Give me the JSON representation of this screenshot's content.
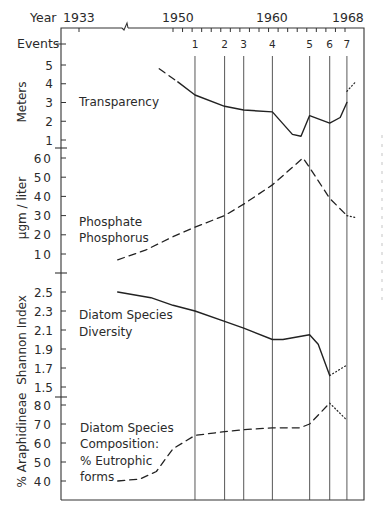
{
  "chart_data": {
    "type": "line",
    "title": "",
    "x_axis": {
      "label": "Year",
      "tick_labels": [
        "1933",
        "1950",
        "1960",
        "1968"
      ],
      "axis_break_between": [
        "1933",
        "1950"
      ],
      "minor_ticks_per_year": 1,
      "range": [
        1933,
        1969
      ]
    },
    "events": {
      "label": "Events",
      "items": [
        {
          "label": "1",
          "year": 1952.3
        },
        {
          "label": "2",
          "year": 1955.4
        },
        {
          "label": "3",
          "year": 1957.4
        },
        {
          "label": "4",
          "year": 1960.4
        },
        {
          "label": "5",
          "year": 1964.3
        },
        {
          "label": "6",
          "year": 1966.4
        },
        {
          "label": "7",
          "year": 1968.2
        }
      ]
    },
    "panels": [
      {
        "name": "transparency",
        "ylabel": "Meters",
        "series_label": [
          "Transparency"
        ],
        "y_ticks": [
          "5",
          "4",
          "3",
          "2",
          "1"
        ],
        "ylim": [
          0.6,
          5.4
        ],
        "segments": [
          {
            "style": "dashed",
            "points": [
              [
                1947.5,
                4.8
              ],
              [
                1950.5,
                4.1
              ]
            ]
          },
          {
            "style": "solid",
            "points": [
              [
                1950.5,
                4.1
              ],
              [
                1952.3,
                3.4
              ],
              [
                1955.4,
                2.8
              ],
              [
                1957.4,
                2.6
              ],
              [
                1960.4,
                2.5
              ],
              [
                1962.5,
                1.3
              ],
              [
                1963.4,
                1.2
              ],
              [
                1964.3,
                2.3
              ],
              [
                1966.4,
                1.9
              ],
              [
                1967.5,
                2.2
              ],
              [
                1968.2,
                3.0
              ]
            ]
          },
          {
            "style": "dotted",
            "points": [
              [
                1968.2,
                3.6
              ],
              [
                1969.1,
                4.1
              ]
            ]
          }
        ]
      },
      {
        "name": "phosphate",
        "ylabel": "μgm / liter",
        "series_label": [
          "Phosphate",
          "Phosphorus"
        ],
        "y_ticks": [
          "60",
          "50",
          "40",
          "30",
          "20",
          "10"
        ],
        "ylim": [
          0,
          65
        ],
        "segments": [
          {
            "style": "dashed",
            "points": [
              [
                1940,
                7
              ],
              [
                1945,
                12
              ],
              [
                1950,
                19
              ],
              [
                1952.3,
                24
              ],
              [
                1955.4,
                30
              ],
              [
                1957.4,
                36
              ],
              [
                1960.4,
                46
              ],
              [
                1963.6,
                60
              ],
              [
                1964.3,
                55
              ],
              [
                1966.4,
                39
              ],
              [
                1968.2,
                30
              ]
            ]
          },
          {
            "style": "dotted",
            "points": [
              [
                1968.2,
                30
              ],
              [
                1969.1,
                29
              ]
            ]
          }
        ]
      },
      {
        "name": "diversity",
        "ylabel": "Shannon Index",
        "series_label": [
          "Diatom Species",
          "Diversity"
        ],
        "y_ticks": [
          "2.5",
          "2.3",
          "2.1",
          "1.9",
          "1.7",
          "1.5"
        ],
        "ylim": [
          1.42,
          2.62
        ],
        "segments": [
          {
            "style": "solid",
            "points": [
              [
                1940,
                2.5
              ],
              [
                1946,
                2.44
              ],
              [
                1950,
                2.36
              ],
              [
                1952.3,
                2.3
              ],
              [
                1955.4,
                2.19
              ],
              [
                1957.4,
                2.12
              ],
              [
                1960.4,
                2.0
              ],
              [
                1961.5,
                2.0
              ],
              [
                1964.3,
                2.05
              ],
              [
                1965.2,
                1.95
              ],
              [
                1966.4,
                1.62
              ]
            ]
          },
          {
            "style": "dotted",
            "points": [
              [
                1966.4,
                1.62
              ],
              [
                1968.2,
                1.73
              ]
            ]
          }
        ]
      },
      {
        "name": "composition",
        "ylabel": "% Araphidineae",
        "series_label": [
          "Diatom Species",
          "Composition:",
          "% Eutrophic",
          "forms"
        ],
        "y_ticks": [
          "80",
          "70",
          "60",
          "50",
          "40"
        ],
        "ylim": [
          30,
          85
        ],
        "segments": [
          {
            "style": "dashed",
            "points": [
              [
                1940,
                40
              ],
              [
                1944,
                41
              ],
              [
                1947,
                45
              ],
              [
                1950,
                57
              ],
              [
                1952.3,
                64
              ],
              [
                1955.4,
                66
              ],
              [
                1957.4,
                67
              ],
              [
                1960.4,
                68
              ],
              [
                1963.3,
                68
              ],
              [
                1964.3,
                70
              ],
              [
                1966.4,
                81
              ]
            ]
          },
          {
            "style": "dotted",
            "points": [
              [
                1966.4,
                81
              ],
              [
                1968.2,
                72
              ]
            ]
          }
        ]
      }
    ]
  }
}
